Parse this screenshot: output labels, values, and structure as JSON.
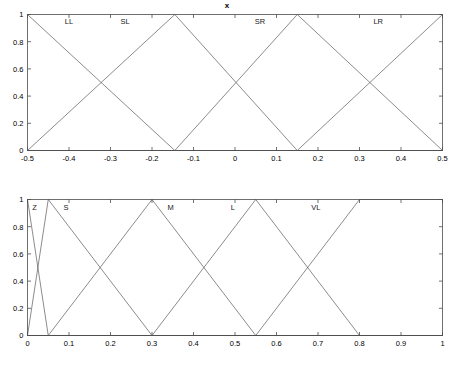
{
  "figure": {
    "background_color": "#ffffff",
    "line_color": "#5a5a5a",
    "axis_color": "#4d4d4d"
  },
  "panels": [
    {
      "name": "x",
      "title": "x"
    },
    {
      "name": "d",
      "title": "d"
    }
  ],
  "chart_data": [
    {
      "type": "line",
      "title": "x",
      "xlabel": "",
      "ylabel": "",
      "xlim": [
        -0.5,
        0.5
      ],
      "ylim": [
        0,
        1
      ],
      "grid": false,
      "legend": "none",
      "xticks": [
        -0.5,
        -0.4,
        -0.3,
        -0.2,
        -0.1,
        0,
        0.1,
        0.2,
        0.3,
        0.4,
        0.5
      ],
      "xticklabels": [
        "-0.5",
        "-0.4",
        "-0.3",
        "-0.2",
        "-0.1",
        "0",
        "0.1",
        "0.2",
        "0.3",
        "0.4",
        "0.5"
      ],
      "yticks": [
        0,
        0.2,
        0.4,
        0.6,
        0.8,
        1
      ],
      "yticklabels": [
        "0",
        "0.2",
        "0.4",
        "0.6",
        "0.8",
        "1"
      ],
      "annotations": [
        {
          "text": "LL",
          "x": -0.4,
          "y": 0.93
        },
        {
          "text": "SL",
          "x": -0.265,
          "y": 0.93
        },
        {
          "text": "SR",
          "x": 0.06,
          "y": 0.93
        },
        {
          "text": "LR",
          "x": 0.345,
          "y": 0.93
        }
      ],
      "series": [
        {
          "name": "LL",
          "x": [
            -0.5,
            -0.145,
            0.5
          ],
          "values": [
            1,
            0,
            0
          ]
        },
        {
          "name": "SL",
          "x": [
            -0.5,
            -0.145,
            0.15,
            0.5
          ],
          "values": [
            0,
            1,
            0,
            0
          ]
        },
        {
          "name": "SR",
          "x": [
            -0.5,
            -0.145,
            0.15,
            0.5
          ],
          "values": [
            0,
            0,
            1,
            0
          ]
        },
        {
          "name": "LR",
          "x": [
            -0.5,
            0.15,
            0.5
          ],
          "values": [
            0,
            0,
            1
          ]
        }
      ]
    },
    {
      "type": "line",
      "title": "d",
      "xlabel": "",
      "ylabel": "",
      "xlim": [
        0,
        1
      ],
      "ylim": [
        0,
        1
      ],
      "grid": false,
      "legend": "none",
      "xticks": [
        0,
        0.1,
        0.2,
        0.3,
        0.4,
        0.5,
        0.6,
        0.7,
        0.8,
        0.9,
        1
      ],
      "xticklabels": [
        "0",
        "0.1",
        "0.2",
        "0.3",
        "0.4",
        "0.5",
        "0.6",
        "0.7",
        "0.8",
        "0.9",
        "1"
      ],
      "yticks": [
        0,
        0.2,
        0.4,
        0.6,
        0.8,
        1
      ],
      "yticklabels": [
        "0",
        "0.2",
        "0.4",
        "0.6",
        "0.8",
        "1"
      ],
      "annotations": [
        {
          "text": "Z",
          "x": 0.017,
          "y": 0.92
        },
        {
          "text": "S",
          "x": 0.093,
          "y": 0.92
        },
        {
          "text": "M",
          "x": 0.345,
          "y": 0.92
        },
        {
          "text": "L",
          "x": 0.495,
          "y": 0.92
        },
        {
          "text": "VL",
          "x": 0.695,
          "y": 0.92
        }
      ],
      "series": [
        {
          "name": "Z",
          "x": [
            0,
            0.05,
            1
          ],
          "values": [
            1,
            0,
            0
          ]
        },
        {
          "name": "S",
          "x": [
            0,
            0.05,
            0.3,
            1
          ],
          "values": [
            0,
            1,
            0,
            0
          ]
        },
        {
          "name": "M",
          "x": [
            0,
            0.05,
            0.3,
            0.55,
            1
          ],
          "values": [
            0,
            0,
            1,
            0,
            0
          ]
        },
        {
          "name": "L",
          "x": [
            0,
            0.3,
            0.55,
            0.8,
            1
          ],
          "values": [
            0,
            0,
            1,
            0,
            0
          ]
        },
        {
          "name": "VL",
          "x": [
            0,
            0.55,
            0.8,
            1
          ],
          "values": [
            0,
            0,
            1,
            1
          ]
        }
      ]
    }
  ]
}
